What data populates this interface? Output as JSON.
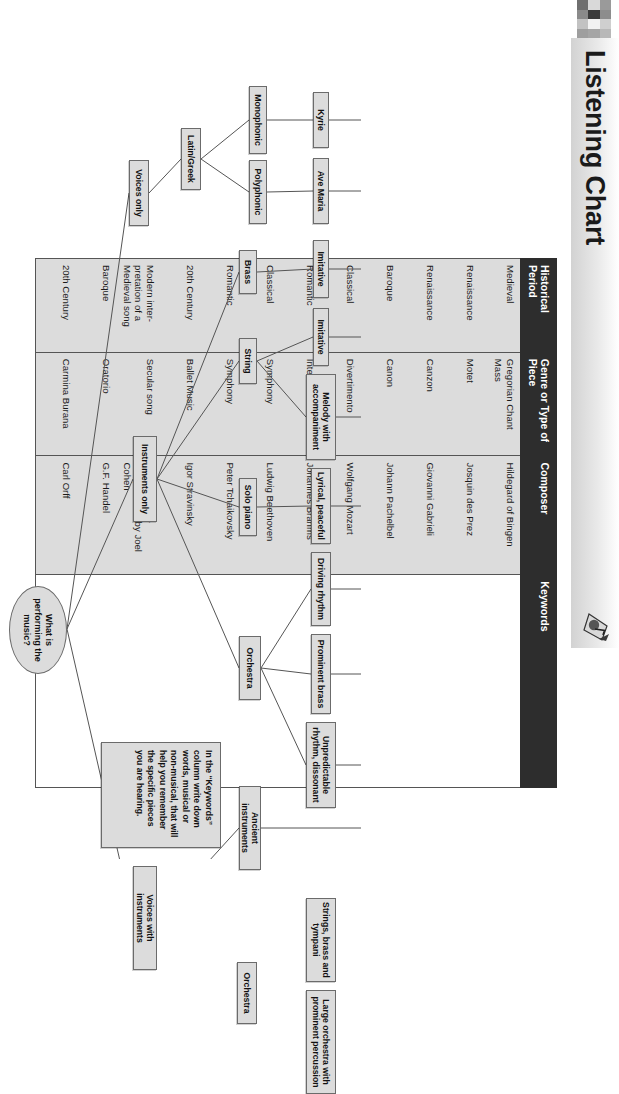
{
  "header": {
    "title": "Listening Chart",
    "note_icon": "musical-note-icon",
    "swatch_colors": [
      "#9a9a9a",
      "#8d8d8d",
      "#cfcfcf",
      "#b8b8b8",
      "#d9d9d9",
      "#3b3b3b",
      "#f2f2f2",
      "#a5a5a5",
      "#6f6f6f",
      "#8a8a8a",
      "#c2c2c2",
      "#9e9e9e"
    ]
  },
  "table": {
    "columns": [
      "Historical Period",
      "Genre or Type of Piece",
      "Composer",
      "Keywords"
    ],
    "rows": [
      {
        "period": "Medieval",
        "genre": "Gregorian Chant Mass",
        "composer": "Hildegard of Bingen",
        "keywords": ""
      },
      {
        "period": "Renaissance",
        "genre": "Motet",
        "composer": "Josquin des Prez",
        "keywords": ""
      },
      {
        "period": "Renaissance",
        "genre": "Canzon",
        "composer": "Giovanni Gabrieli",
        "keywords": ""
      },
      {
        "period": "Baroque",
        "genre": "Canon",
        "composer": "Johann Pachelbel",
        "keywords": ""
      },
      {
        "period": "Classical",
        "genre": "Divertimento",
        "composer": "Wolfgang Mozart",
        "keywords": ""
      },
      {
        "period": "Romantic",
        "genre": "Intermezzo",
        "composer": "Johannes Brahms",
        "keywords": ""
      },
      {
        "period": "Classical",
        "genre": "Symphony",
        "composer": "Ludwig Beethoven",
        "keywords": ""
      },
      {
        "period": "Romantic",
        "genre": "Symphony",
        "composer": "Peter Tchaikovsky",
        "keywords": ""
      },
      {
        "period": "20th Century",
        "genre": "Ballet Music",
        "composer": "Igor Stravinsky",
        "keywords": ""
      },
      {
        "period": "Modern inter-pretation of a Medieval song",
        "genre": "Secular song",
        "composer": "Anonymous—Interpretation by Joel Cohen",
        "keywords": ""
      },
      {
        "period": "Baroque",
        "genre": "Oratorio",
        "composer": "G.F. Handel",
        "keywords": ""
      },
      {
        "period": "20th Century",
        "genre": "Carmina Burana",
        "composer": "Carl Orff",
        "keywords": ""
      }
    ]
  },
  "diagram": {
    "root_label": "What is performing the music?",
    "nodes": [
      {
        "id": "kyrie",
        "label": "Kyrie"
      },
      {
        "id": "ave-maria",
        "label": "Ave Maria"
      },
      {
        "id": "imitative-1",
        "label": "Imitative"
      },
      {
        "id": "imitative-2",
        "label": "Imitative"
      },
      {
        "id": "melody-accompaniment",
        "label": "Melody with accompaniment"
      },
      {
        "id": "lyrical-peaceful",
        "label": "Lyrical, peaceful"
      },
      {
        "id": "driving-rhythm",
        "label": "Driving rhythm"
      },
      {
        "id": "prominent-brass",
        "label": "Prominent brass"
      },
      {
        "id": "unpredictable-rhythm",
        "label": "Unpredictable rhythm, dissonant"
      },
      {
        "id": "strings-brass-tympani",
        "label": "Strings, brass and tympani"
      },
      {
        "id": "large-orchestra",
        "label": "Large orchestra with prominent percussion"
      },
      {
        "id": "monophonic",
        "label": "Monophonic"
      },
      {
        "id": "polyphonic",
        "label": "Polyphonic"
      },
      {
        "id": "brass",
        "label": "Brass"
      },
      {
        "id": "string",
        "label": "String"
      },
      {
        "id": "solo-piano",
        "label": "Solo piano"
      },
      {
        "id": "orchestra-1",
        "label": "Orchestra"
      },
      {
        "id": "ancient-instruments",
        "label": "Ancient instruments"
      },
      {
        "id": "orchestra-2",
        "label": "Orchestra"
      },
      {
        "id": "latin-greek",
        "label": "Latin/Greek"
      },
      {
        "id": "voices-only",
        "label": "Voices only"
      },
      {
        "id": "instruments-only",
        "label": "Instruments only"
      },
      {
        "id": "voices-with-instruments",
        "label": "Voices with instruments"
      }
    ],
    "keywords_note": "In the “Keywords” column write down words, musical or non-musical, that will help you remember the specific pieces you are hearing."
  }
}
